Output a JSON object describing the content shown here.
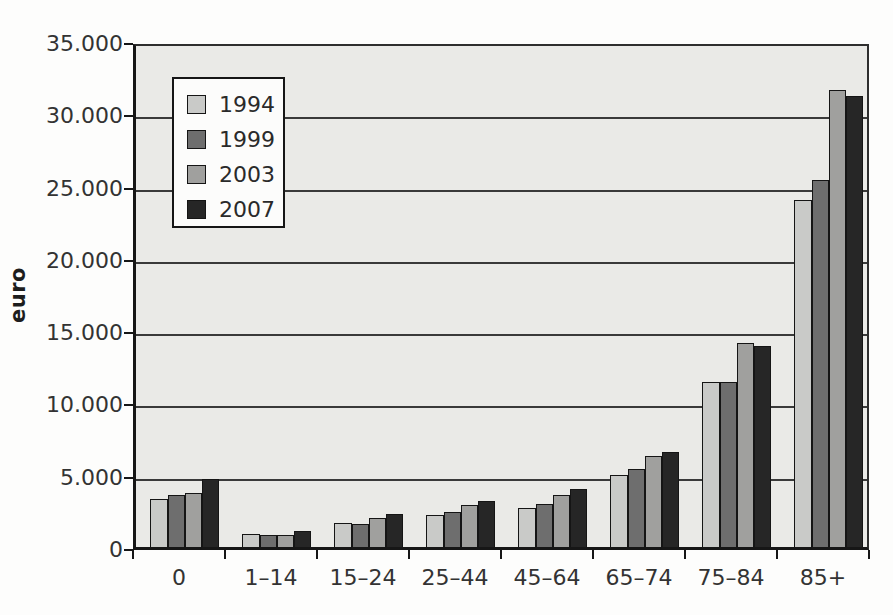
{
  "figure": {
    "y_axis_title": "euro"
  },
  "chart_data": {
    "type": "bar",
    "title": "",
    "xlabel": "",
    "ylabel": "euro",
    "categories": [
      "0",
      "1–14",
      "15–24",
      "25–44",
      "45–64",
      "65–74",
      "75–84",
      "85+"
    ],
    "series": [
      {
        "name": "1994",
        "color": "#c9cac8",
        "values": [
          3300,
          900,
          1650,
          2200,
          2700,
          5000,
          11400,
          24000
        ]
      },
      {
        "name": "1999",
        "color": "#6e6e6e",
        "values": [
          3600,
          800,
          1600,
          2400,
          3000,
          5400,
          11400,
          25400
        ]
      },
      {
        "name": "2003",
        "color": "#a0a09e",
        "values": [
          3750,
          800,
          2000,
          2900,
          3600,
          6300,
          14100,
          31600
        ]
      },
      {
        "name": "2007",
        "color": "#262626",
        "values": [
          4700,
          1100,
          2300,
          3200,
          4000,
          6600,
          13900,
          31200
        ]
      }
    ],
    "ylim": [
      0,
      35000
    ],
    "ytick_step": 5000,
    "ytick_labels": [
      "0",
      "5.000",
      "10.000",
      "15.000",
      "20.000",
      "25.000",
      "30.000",
      "35.000"
    ],
    "grid": true,
    "plot_background": "#eaeae7",
    "legend_position": "upper-left-inside"
  }
}
